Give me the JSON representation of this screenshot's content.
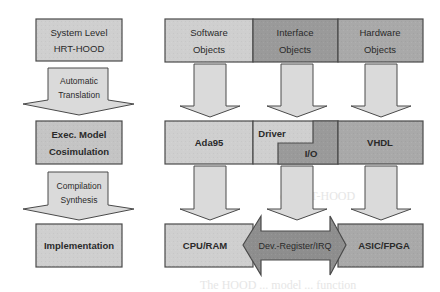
{
  "colors": {
    "light_box": "#cfcfcf",
    "medium_box": "#a9a9a9",
    "dark_box": "#9a9a9a",
    "arrow_fill": "#dadada",
    "border": "#4a4a4a",
    "double_arrow": "#8e8e8e"
  },
  "left_column": {
    "boxes": [
      {
        "line1": "System Level",
        "line2": "HRT-HOOD"
      },
      {
        "line1": "Exec. Model",
        "line2": "Cosimulation"
      },
      {
        "line1": "Implementation",
        "line2": ""
      }
    ],
    "arrows": [
      {
        "line1": "Automatic",
        "line2": "Translation"
      },
      {
        "line1": "Compilation",
        "line2": "Synthesis"
      }
    ]
  },
  "top_row": [
    {
      "line1": "Software",
      "line2": "Objects"
    },
    {
      "line1": "Interface",
      "line2": "Objects"
    },
    {
      "line1": "Hardware",
      "line2": "Objects"
    }
  ],
  "middle_row": {
    "software": "Ada95",
    "interface_upper": "Driver",
    "interface_lower": "I/O",
    "hardware": "VHDL"
  },
  "bottom_row": {
    "software": "CPU/RAM",
    "interface_arrow": "Dev.-Register/IRQ",
    "hardware": "ASIC/FPGA"
  },
  "background_fragments": [
    "ed HRT-HOOD",
    "for embedded system...",
    "The HOOD ... model ... function"
  ]
}
